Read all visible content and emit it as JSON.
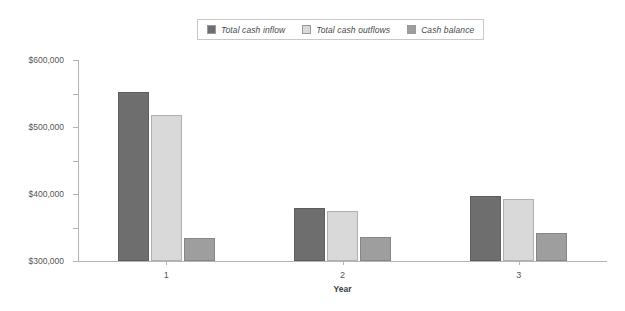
{
  "chart_data": {
    "type": "bar",
    "title": "",
    "xlabel": "Year",
    "ylabel": "",
    "categories": [
      "1",
      "2",
      "3"
    ],
    "series": [
      {
        "name": "Total cash inflow",
        "color": "#6e6e6e",
        "values": [
          505000,
          157000,
          195000
        ]
      },
      {
        "name": "Total cash outflows",
        "color": "#d9d9d9",
        "values": [
          437000,
          150000,
          185000
        ]
      },
      {
        "name": "Cash balance",
        "color": "#9e9e9e",
        "values": [
          68000,
          73000,
          83000
        ]
      }
    ],
    "ylim": [
      0,
      600000
    ],
    "ytick_values": [
      0,
      100000,
      200000,
      300000,
      400000,
      500000,
      600000
    ],
    "ytick_labels": [
      "$0",
      "$100,000",
      "$200,000",
      "$300,000",
      "$400,000",
      "$500,000",
      "$600,000"
    ],
    "grid": false,
    "legend_position": "top-center"
  },
  "legend": {
    "entries": [
      {
        "label": "Total cash inflow"
      },
      {
        "label": "Total cash outflows"
      },
      {
        "label": "Cash balance"
      }
    ]
  },
  "axes": {
    "x_title": "Year",
    "x_labels": [
      "1",
      "2",
      "3"
    ]
  }
}
